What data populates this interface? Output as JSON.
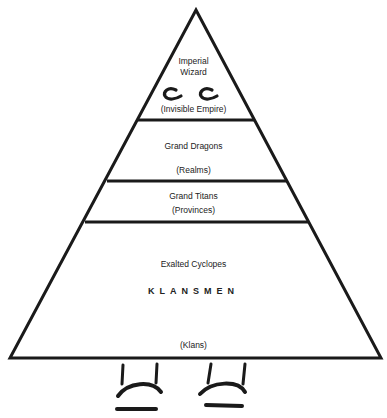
{
  "diagram": {
    "type": "hierarchy-pyramid",
    "line_color": "#1a1a1a",
    "background": "#ffffff",
    "tiers": [
      {
        "id": "tier-1",
        "title_line1": "Imperial",
        "title_line2": "Wizard",
        "domain": "(Invisible Empire)"
      },
      {
        "id": "tier-2",
        "title": "Grand Dragons",
        "domain": "(Realms)"
      },
      {
        "id": "tier-3",
        "title": "Grand Titans",
        "domain": "(Provinces)"
      },
      {
        "id": "tier-4",
        "title": "Exalted Cyclopes",
        "members": "KLANSMEN",
        "domain": "(Klans)"
      }
    ],
    "decorations": [
      "eyes-drawing",
      "feet-drawing"
    ]
  }
}
